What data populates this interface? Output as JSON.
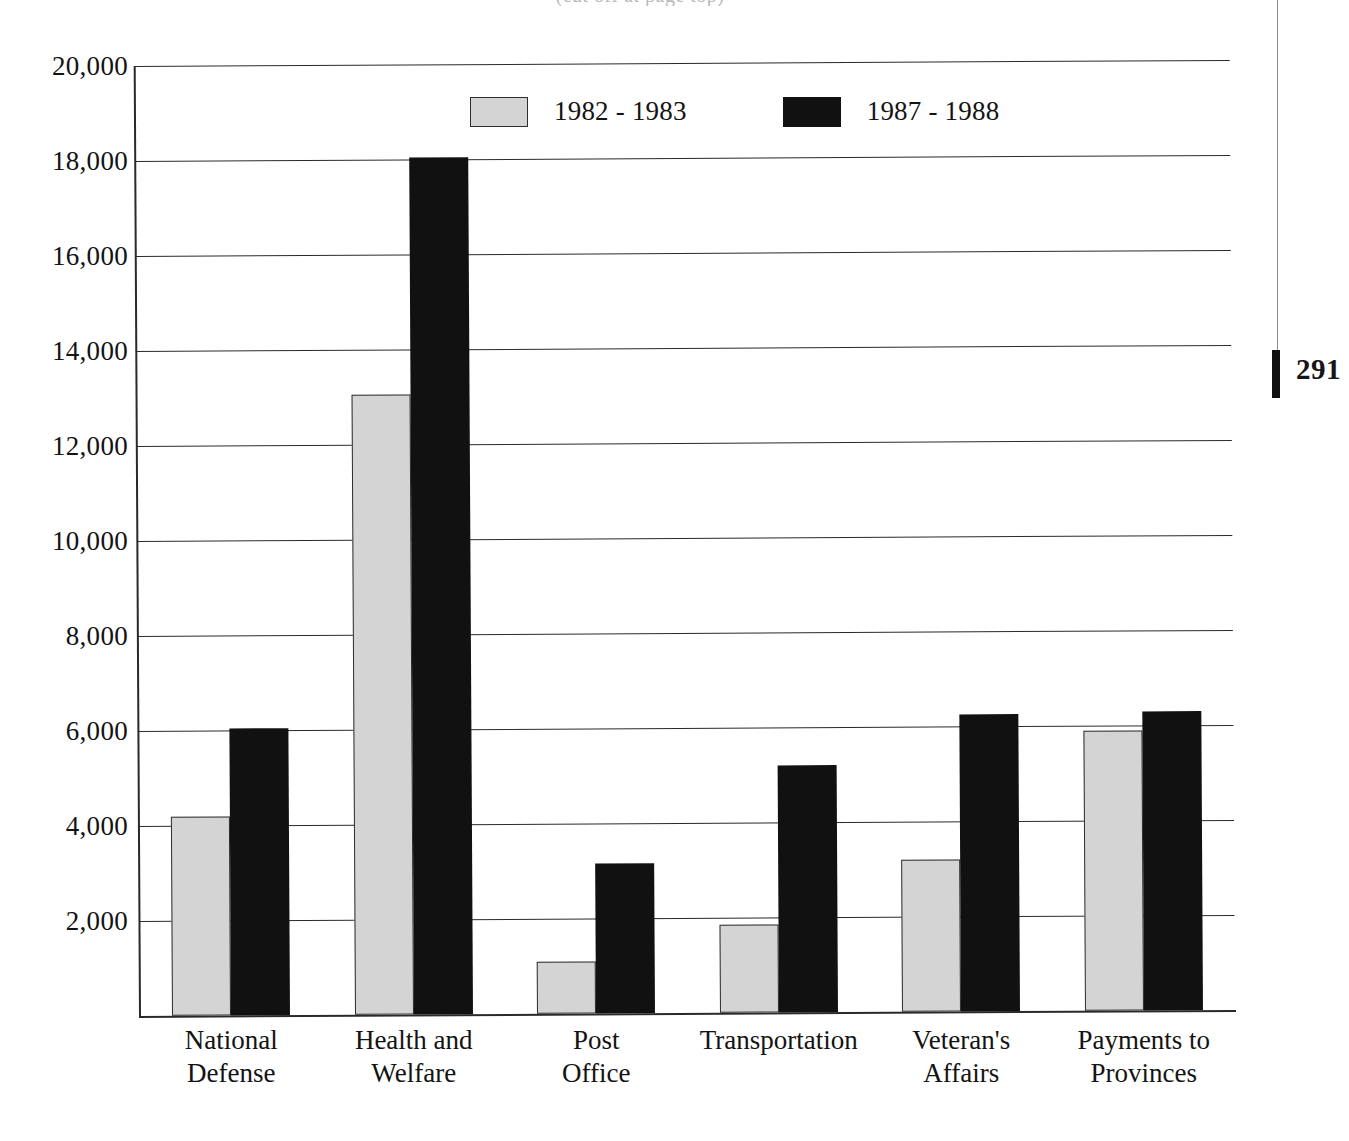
{
  "page": {
    "number": "291",
    "subtitle_clipped": "(cut off at page top)"
  },
  "chart_data": {
    "type": "bar",
    "title": "",
    "subtitle": "",
    "xlabel": "",
    "ylabel": "",
    "ylim": [
      0,
      20000
    ],
    "grid": true,
    "legend_position": "top-center",
    "categories": [
      "National\nDefense",
      "Health and\nWelfare",
      "Post\nOffice",
      "Transportation",
      "Veteran's\nAffairs",
      "Payments to\nProvinces"
    ],
    "ytick_labels": [
      "2,000",
      "4,000",
      "6,000",
      "8,000",
      "10,000",
      "12,000",
      "14,000",
      "16,000",
      "18,000",
      "20,000"
    ],
    "ytick_values": [
      2000,
      4000,
      6000,
      8000,
      10000,
      12000,
      14000,
      16000,
      18000,
      20000
    ],
    "series": [
      {
        "name": "1982 - 1983",
        "color": "#d4d4d4",
        "values": [
          4200,
          13050,
          1100,
          1850,
          3200,
          5900
        ]
      },
      {
        "name": "1987 - 1988",
        "color": "#111111",
        "values": [
          6050,
          18050,
          3150,
          5200,
          6250,
          6300
        ]
      }
    ]
  }
}
